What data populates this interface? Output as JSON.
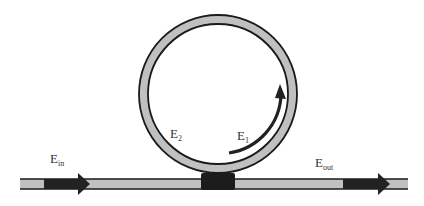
{
  "diagram": {
    "type": "ring-resonator",
    "colors": {
      "background": "#ffffff",
      "waveguide_fill": "#c0c0c0",
      "outline": "#1a1a1a",
      "coupler": "#1c1c1c",
      "arrow": "#222222",
      "label": "#333333"
    },
    "labels": {
      "input": {
        "main": "E",
        "sub": "in"
      },
      "output": {
        "main": "E",
        "sub": "out"
      },
      "ring_field_2": {
        "main": "E",
        "sub": "2"
      },
      "ring_field_1": {
        "main": "E",
        "sub": "1"
      }
    },
    "ring": {
      "cx": 218,
      "cy": 94,
      "outer_r": 79,
      "inner_r": 70
    },
    "bus_waveguide": {
      "x1": 20,
      "x2": 408,
      "y_top": 179,
      "y_bottom": 189
    },
    "coupler": {
      "x": 201,
      "y": 173,
      "width": 34,
      "height": 17
    }
  }
}
